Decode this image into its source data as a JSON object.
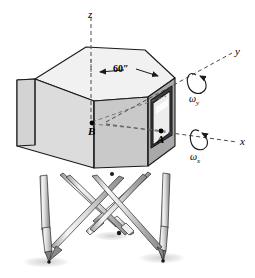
{
  "figure": {
    "name": "motion-simulator-stewart-platform",
    "background_color": "#ffffff",
    "line_color": "#1a1a1a",
    "dashed_color": "#555555"
  },
  "axes": [
    {
      "id": "z",
      "label": "z",
      "style": "dashed",
      "direction": "vertical-up"
    },
    {
      "id": "y",
      "label": "y",
      "style": "dashed",
      "direction": "upper-right"
    },
    {
      "id": "x",
      "label": "x",
      "style": "dashed",
      "direction": "right"
    }
  ],
  "rotations": [
    {
      "id": "omega-y",
      "symbol": "ω",
      "subscript": "y",
      "about_axis": "y"
    },
    {
      "id": "omega-x",
      "symbol": "ω",
      "subscript": "x",
      "about_axis": "x"
    }
  ],
  "points": [
    {
      "id": "A",
      "label": "A",
      "description": "point on window face"
    },
    {
      "id": "B",
      "label": "B",
      "description": "point on front center face"
    }
  ],
  "dimensions": [
    {
      "id": "width",
      "label": "60″",
      "value": 60,
      "unit": "in"
    }
  ],
  "cabin": {
    "name": "hexagonal-cabin",
    "top_face_color": "#f1f1f1",
    "left_face_color": "#dcdcdc",
    "front_face_color": "#c9c9c9",
    "right_face_color": "#a9a9a9",
    "window_color": "#ededed"
  },
  "legs": {
    "name": "hydraulic-actuator-legs",
    "count": 6,
    "body_color": "#d5d5d5",
    "highlight_color": "#f4f4f4",
    "shadow_color": "#8d8d8d"
  },
  "ground": {
    "shadow_color": "#e3e3e3"
  }
}
